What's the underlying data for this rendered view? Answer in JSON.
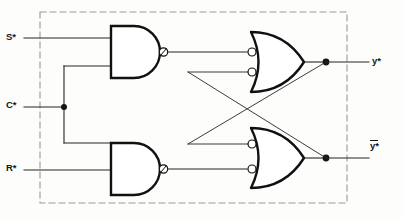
{
  "diagram": {
    "type": "logic-circuit"
  },
  "inputs": [
    {
      "id": "s",
      "label": "S*",
      "name": "input-label-s",
      "x": 6,
      "y": 33
    },
    {
      "id": "c",
      "label": "C*",
      "name": "input-label-c",
      "x": 6,
      "y": 101
    },
    {
      "id": "r",
      "label": "R*",
      "name": "input-label-r",
      "x": 6,
      "y": 163
    }
  ],
  "outputs": [
    {
      "id": "y",
      "label": "y*",
      "overbar": false,
      "name": "output-label-y",
      "x": 371,
      "y": 56
    },
    {
      "id": "ybar",
      "label": "y*",
      "overbar": true,
      "name": "output-label-y-bar",
      "x": 371,
      "y": 141
    }
  ],
  "gates": [
    {
      "id": "nand-top",
      "type": "NAND",
      "name": "nand-gate-top",
      "inputs": [
        "S*",
        "C*"
      ],
      "inverted_output": true
    },
    {
      "id": "nand-bottom",
      "type": "NAND",
      "name": "nand-gate-bottom",
      "inputs": [
        "C*",
        "R*"
      ],
      "inverted_output": true
    },
    {
      "id": "or-top",
      "type": "OR",
      "name": "or-gate-top",
      "inputs": [
        "nand-top",
        "ybar"
      ],
      "inverted_inputs": true
    },
    {
      "id": "or-bottom",
      "type": "OR",
      "name": "or-gate-bottom",
      "inputs": [
        "y",
        "nand-bottom"
      ],
      "inverted_inputs": true
    }
  ],
  "boundary": {
    "name": "module-boundary",
    "style": "dashed",
    "x": 40,
    "y": 12,
    "width": 307,
    "height": 191
  },
  "colors": {
    "line": "#262626",
    "gate_stroke": "#111111",
    "dashed": "#8c8c8c",
    "background": "#fdfdfb",
    "text": "#151515"
  }
}
